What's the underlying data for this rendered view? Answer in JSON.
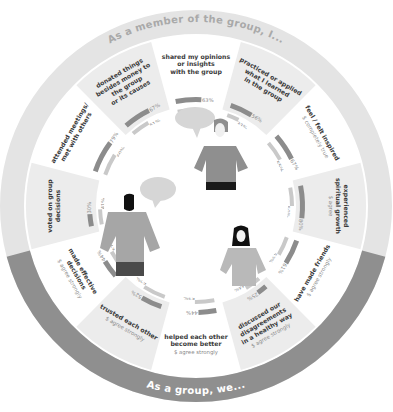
{
  "chart_data": {
    "type": "radial-bar",
    "title_top": "As a member of the group, I...",
    "title_bottom": "As a group, we...",
    "segments": [
      {
        "label": [
          "shared my opinions",
          "or insights",
          "with the group"
        ],
        "sub": "",
        "values": [
          63,
          45
        ],
        "group": "I"
      },
      {
        "label": [
          "practiced or applied",
          "what I learned",
          "in the group"
        ],
        "sub": "",
        "values": [
          56,
          33
        ],
        "group": "I"
      },
      {
        "label": [
          "feel / felt inspired"
        ],
        "sub": "$ completely true",
        "values": [
          67,
          55
        ],
        "group": "I"
      },
      {
        "label": [
          "experienced",
          "spiritual growth"
        ],
        "sub": "$ agree",
        "values": [
          80,
          50
        ],
        "group": "I"
      },
      {
        "label": [
          "have made friends"
        ],
        "sub": "$ agree strongly",
        "values": [
          61,
          52
        ],
        "group": "I"
      },
      {
        "label": [
          "discussed our",
          "disagreements",
          "in a healthy way"
        ],
        "sub": "$ agree strongly",
        "values": [
          25,
          44
        ],
        "group": "we"
      },
      {
        "label": [
          "helped each other",
          "become better"
        ],
        "sub": "$ agree strongly",
        "values": [
          44,
          53
        ],
        "group": "we"
      },
      {
        "label": [
          "trusted each other"
        ],
        "sub": "$ agree strongly",
        "values": [
          52,
          62
        ],
        "group": "we"
      },
      {
        "label": [
          "made effective",
          "decisions"
        ],
        "sub": "$ agree strongly",
        "values": [
          44,
          57
        ],
        "group": "we"
      },
      {
        "label": [
          "voted on group",
          "decisions"
        ],
        "sub": "",
        "values": [
          30,
          41
        ],
        "group": "I"
      },
      {
        "label": [
          "attended meetings/",
          "met with others"
        ],
        "sub": "",
        "values": [
          79,
          60
        ],
        "group": "I"
      },
      {
        "label": [
          "donated things",
          "besides money to",
          "the group",
          "or its causes"
        ],
        "sub": "",
        "values": [
          67,
          51
        ],
        "group": "I"
      }
    ],
    "legend": [],
    "colors": {
      "bar_dark": "#8c8c8c",
      "bar_light": "#c9c9c9",
      "ring_outer": "#e4e4e4",
      "ring_bottom": "#8f8f8f"
    }
  },
  "header": {
    "title": "As a member of the group, I..."
  },
  "footer": {
    "title": "As a group, we..."
  },
  "illustrations": [
    {
      "name": "woman-standing-speech",
      "desc": "woman with speech bubble"
    },
    {
      "name": "man-standing-speech",
      "desc": "man with speech bubble"
    },
    {
      "name": "woman-hands-on-hips",
      "desc": "woman standing"
    }
  ]
}
